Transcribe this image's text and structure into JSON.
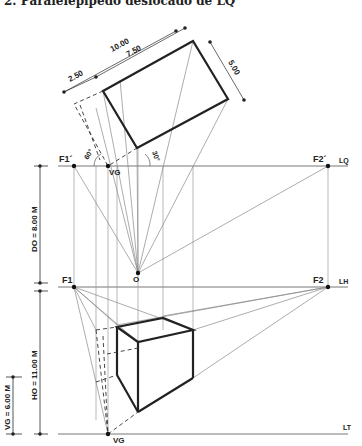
{
  "title": "2. Paralelepípedo deslocado de LQ",
  "labels": {
    "f1_prime": "F1´",
    "f2_prime": "F2´",
    "vg_upper": "VG",
    "lq": "LQ",
    "f1": "F1",
    "f2": "F2",
    "lh": "LH",
    "lt": "LT",
    "vg_lower": "VG",
    "o": "O",
    "angle_60": "60°",
    "angle_30": "30°"
  },
  "dimensions": {
    "d_10": "10.00",
    "d_7_50": "7.50",
    "d_2_50": "2.50",
    "d_5": "5.00",
    "do": "DO = 8.00 M",
    "ho": "HO = 11.00 M",
    "vg": "VG = 6.00 M"
  }
}
